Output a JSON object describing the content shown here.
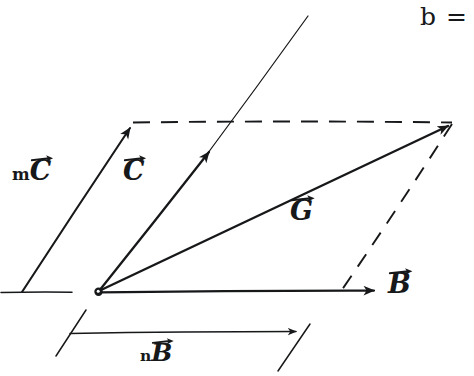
{
  "figure": {
    "kind": "hand-drawn-vector-diagram",
    "background_color": "#ffffff",
    "ink_color": "#17181a",
    "labels": {
      "m_scalar": "m",
      "n_scalar": "n",
      "vector_C": "C",
      "vector_B": "B",
      "vector_G": "G",
      "corner_text": "b ="
    },
    "label_positions": [
      {
        "name": "mC",
        "x": 12,
        "y": 157
      },
      {
        "name": "C",
        "x": 123,
        "y": 157
      },
      {
        "name": "G",
        "x": 290,
        "y": 197
      },
      {
        "name": "B",
        "x": 388,
        "y": 270
      },
      {
        "name": "nB",
        "x": 140,
        "y": 340
      },
      {
        "name": "b-eq",
        "x": 420,
        "y": 4
      }
    ],
    "geometry": {
      "origin": {
        "x": 98,
        "y": 292
      },
      "vector_C_tip": {
        "x": 212,
        "y": 148
      },
      "vector_C_extension_tip": {
        "x": 308,
        "y": 16
      },
      "vector_mC_base": {
        "x": 22,
        "y": 292
      },
      "vector_mC_tip": {
        "x": 133,
        "y": 124
      },
      "vector_B_tip": {
        "x": 378,
        "y": 290
      },
      "vector_G_tip": {
        "x": 452,
        "y": 122
      },
      "dashed_top_from": {
        "x": 133,
        "y": 122
      },
      "dashed_top_to": {
        "x": 452,
        "y": 122
      },
      "dashed_side_from": {
        "x": 452,
        "y": 124
      },
      "dashed_side_to": {
        "x": 338,
        "y": 296
      },
      "measure_line_from": {
        "x": 70,
        "y": 333
      },
      "measure_line_to": {
        "x": 300,
        "y": 331
      },
      "measure_tick_left": {
        "x1": 56,
        "y1": 356,
        "x2": 86,
        "y2": 310
      },
      "measure_tick_right": {
        "x1": 278,
        "y1": 371,
        "x2": 310,
        "y2": 324
      },
      "baseline_left_from": {
        "x": 0,
        "y": 292
      },
      "baseline_left_to": {
        "x": 72,
        "y": 292
      }
    }
  }
}
